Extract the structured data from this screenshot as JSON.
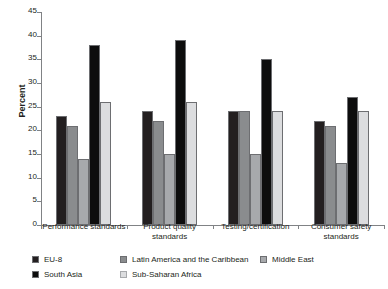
{
  "chart_data": {
    "type": "bar",
    "title": "",
    "xlabel": "",
    "ylabel": "Percent",
    "ylim": [
      0,
      45
    ],
    "ytick_interval": 5,
    "yticks": [
      0,
      5,
      10,
      15,
      20,
      25,
      30,
      35,
      40,
      45
    ],
    "grid": false,
    "legend_position": "bottom",
    "categories": [
      "Performance standards",
      "Product quality standards",
      "Testing/certification",
      "Consumer safety standards"
    ],
    "series": [
      {
        "name": "EU-8",
        "color": "#231f20",
        "values": [
          23,
          24,
          24,
          22
        ]
      },
      {
        "name": "Latin America and the Caribbean",
        "color": "#8a8c8e",
        "values": [
          21,
          22,
          24,
          21
        ]
      },
      {
        "name": "Middle East",
        "color": "#a7a9ac",
        "values": [
          14,
          15,
          15,
          13
        ]
      },
      {
        "name": "South Asia",
        "color": "#0d0d0d",
        "values": [
          38,
          39,
          35,
          27
        ]
      },
      {
        "name": "Sub-Saharan Africa",
        "color": "#dcdddf",
        "values": [
          26,
          26,
          24,
          24
        ]
      }
    ]
  },
  "legend": {
    "items": [
      {
        "label": "EU-8"
      },
      {
        "label": "Latin America and the Caribbean"
      },
      {
        "label": "Middle East"
      },
      {
        "label": "South Asia"
      },
      {
        "label": "Sub-Saharan Africa"
      }
    ]
  }
}
